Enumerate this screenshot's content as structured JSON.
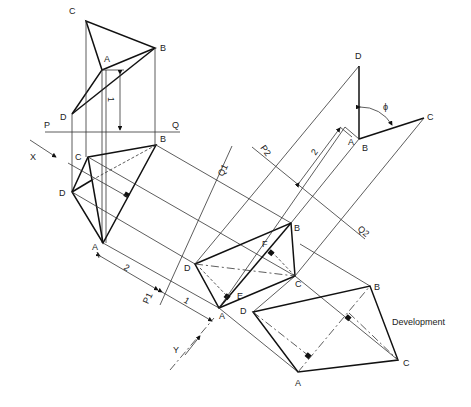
{
  "top_view": {
    "vertices": [
      "A",
      "B",
      "C",
      "D"
    ],
    "plane_line": {
      "left": "P",
      "right": "Q"
    },
    "dimension_label": "1"
  },
  "front_view": {
    "vertices": [
      "A",
      "B",
      "C",
      "D"
    ],
    "view_arrow_label": "X"
  },
  "auxiliary_view_1": {
    "vertices": [
      "A",
      "B",
      "C",
      "D"
    ],
    "foot_labels": [
      "E",
      "F"
    ],
    "reference_line": {
      "p": "P1",
      "q": "Q1"
    },
    "dimension_labels": [
      "2",
      "1"
    ],
    "view_arrow_label": "Y"
  },
  "auxiliary_view_2": {
    "vertices": [
      "A",
      "B",
      "C",
      "D"
    ],
    "reference_line": {
      "p": "P2",
      "q": "Q2"
    },
    "dimension_label": "2",
    "angle_label": "ϕ"
  },
  "development": {
    "vertices": [
      "A",
      "B",
      "C",
      "D"
    ],
    "label": "Development"
  }
}
